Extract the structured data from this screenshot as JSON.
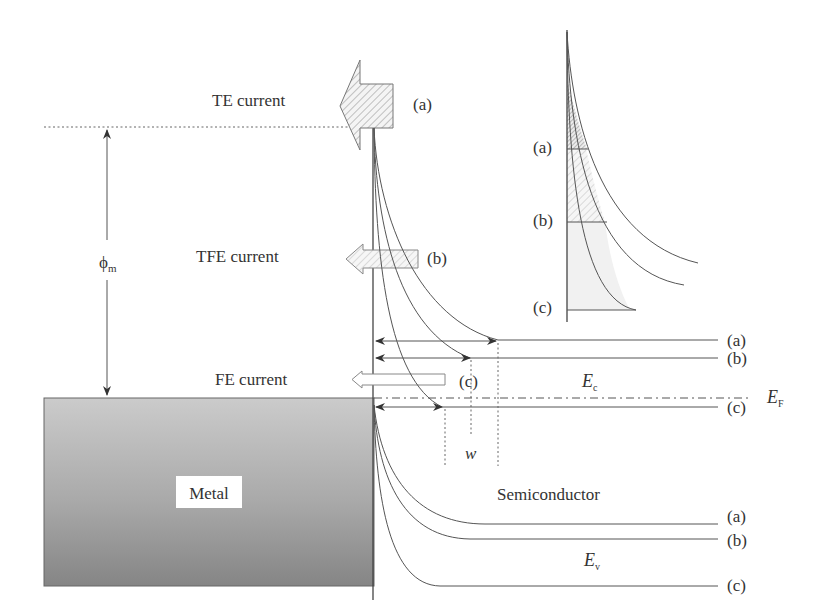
{
  "labels": {
    "te_current": "TE current",
    "tfe_current": "TFE current",
    "fe_current": "FE current",
    "phi_m": "ϕ",
    "phi_m_sub": "m",
    "metal": "Metal",
    "semiconductor": "Semiconductor",
    "ec": "E",
    "ec_sub": "c",
    "ev": "E",
    "ev_sub": "v",
    "ef": "E",
    "ef_sub": "F",
    "w": "w"
  },
  "cases": {
    "a": "(a)",
    "b": "(b)",
    "c": "(c)"
  },
  "colors": {
    "metal_top": "#c8c8c8",
    "metal_bottom": "#8a8a8a",
    "line": "#444444",
    "text": "#333333",
    "hatch": "#888888"
  }
}
